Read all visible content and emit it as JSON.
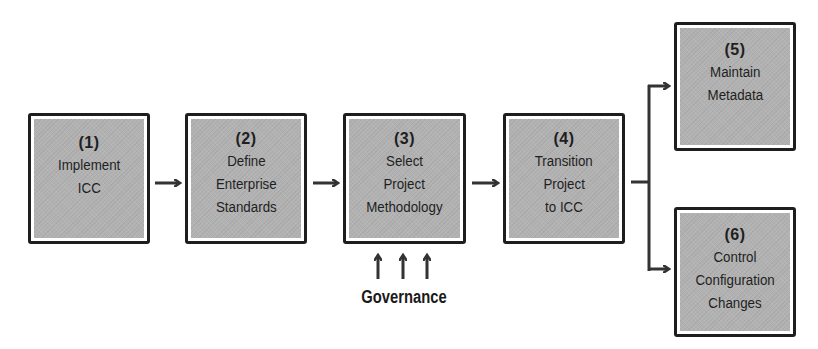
{
  "diagram": {
    "steps": [
      {
        "number": "(1)",
        "lines": [
          "Implement",
          "ICC"
        ]
      },
      {
        "number": "(2)",
        "lines": [
          "Define",
          "Enterprise",
          "Standards"
        ]
      },
      {
        "number": "(3)",
        "lines": [
          "Select",
          "Project",
          "Methodology"
        ]
      },
      {
        "number": "(4)",
        "lines": [
          "Transition",
          "Project",
          "to ICC"
        ]
      },
      {
        "number": "(5)",
        "lines": [
          "Maintain",
          "Metadata"
        ]
      },
      {
        "number": "(6)",
        "lines": [
          "Control",
          "Configuration",
          "Changes"
        ]
      }
    ],
    "governance": {
      "label": "Governance",
      "arrow_count": 3
    },
    "colors": {
      "box_border": "#1e1e1e",
      "box_fill": "#b2b2b2",
      "arrow": "#333333",
      "text": "#1f1f1f"
    }
  }
}
